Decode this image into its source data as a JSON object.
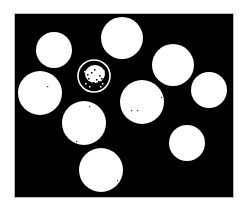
{
  "image": {
    "description": "Binary thresholded image: white circular blobs on black background, one circle shown as a ring with speckled interior",
    "background_color": "#000000",
    "blob_color": "#ffffff",
    "canvas": {
      "x": 14,
      "y": 13,
      "width": 220,
      "height": 185
    },
    "circles": [
      {
        "id": "c1",
        "cx": 54,
        "cy": 50,
        "r": 18,
        "style": "filled"
      },
      {
        "id": "c2",
        "cx": 122,
        "cy": 38,
        "r": 21,
        "style": "filled"
      },
      {
        "id": "c3",
        "cx": 94,
        "cy": 76,
        "r": 17,
        "style": "ring-speckled"
      },
      {
        "id": "c4",
        "cx": 173,
        "cy": 65,
        "r": 21,
        "style": "filled"
      },
      {
        "id": "c5",
        "cx": 40,
        "cy": 93,
        "r": 22,
        "style": "filled"
      },
      {
        "id": "c6",
        "cx": 209,
        "cy": 90,
        "r": 18,
        "style": "filled"
      },
      {
        "id": "c7",
        "cx": 142,
        "cy": 102,
        "r": 22,
        "style": "filled"
      },
      {
        "id": "c8",
        "cx": 84,
        "cy": 123,
        "r": 22,
        "style": "filled"
      },
      {
        "id": "c9",
        "cx": 187,
        "cy": 143,
        "r": 18,
        "style": "filled"
      },
      {
        "id": "c10",
        "cx": 101,
        "cy": 170,
        "r": 22,
        "style": "filled"
      }
    ]
  }
}
